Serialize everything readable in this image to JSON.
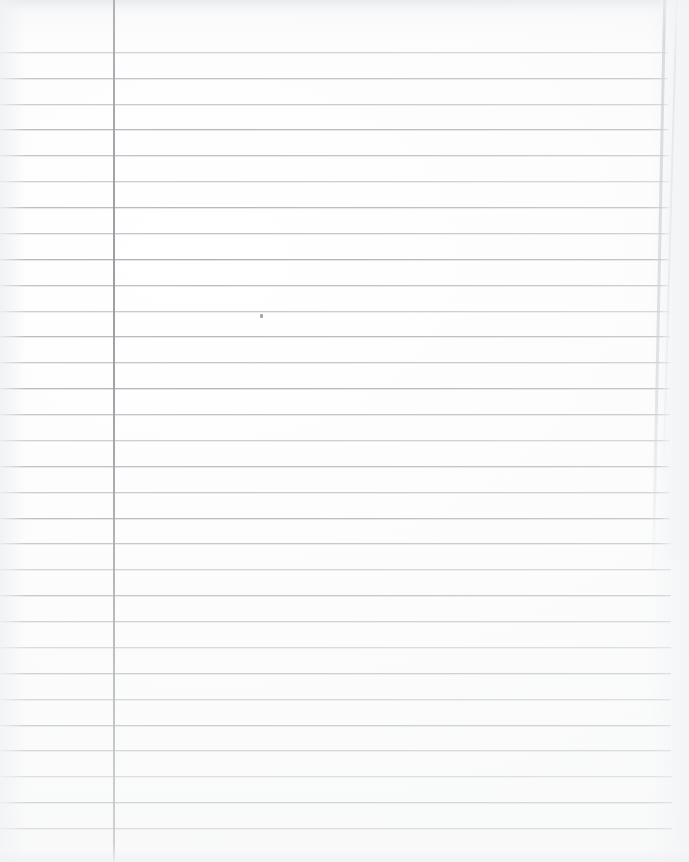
{
  "document": {
    "kind": "scanned-lined-notebook-paper",
    "title": "Blank lined notebook page",
    "orientation": "portrait",
    "width_px": 689,
    "height_px": 862,
    "written_content": "",
    "is_blank": true
  },
  "paper": {
    "background_color": "#ffffff",
    "scan_tint_color": "#f4f5f6",
    "rule_color": "#a9adb2",
    "margin_rule_color": "#8e9398",
    "edge_shadow_color": "#adb1b6"
  },
  "ruling": {
    "style": "wide-ruled-single-margin",
    "first_line_y": 52,
    "line_spacing_px": 25.9,
    "line_count": 31,
    "line_y_positions": [
      52,
      78,
      104,
      129,
      155,
      181,
      207,
      233,
      259,
      285,
      311,
      336,
      362,
      388,
      414,
      440,
      466,
      492,
      518,
      543,
      569,
      595,
      621,
      647,
      673,
      699,
      725,
      750,
      776,
      802,
      828
    ],
    "line_left_x": 0,
    "line_right_x": 668
  },
  "margin": {
    "vertical_rule_x": 113,
    "vertical_rule_width": 2,
    "vertical_rule_top": 0,
    "vertical_rule_bottom": 862
  },
  "artifacts": {
    "specks": [
      {
        "x": 260,
        "y": 314
      }
    ],
    "right_edge_x": 668,
    "right_edge_tilt_deg": 1.15
  }
}
